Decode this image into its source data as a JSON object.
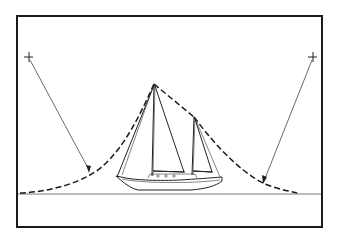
{
  "figure": {
    "frame": {
      "x": 17,
      "y": 16,
      "width": 305,
      "height": 211
    },
    "horizon_y": 194,
    "colors": {
      "ink": "#1a1a1a",
      "background": "#ffffff"
    },
    "elements": [
      {
        "name": "left-sighting-mark",
        "x": 28,
        "y": 57
      },
      {
        "name": "right-sighting-mark",
        "x": 312,
        "y": 57
      },
      {
        "name": "main-masthead",
        "x": 154,
        "y": 84
      },
      {
        "name": "mizzen-masthead",
        "x": 194,
        "y": 117
      },
      {
        "name": "left-arrow-tip",
        "x": 89,
        "y": 172
      },
      {
        "name": "right-arrow-tip",
        "x": 263,
        "y": 183
      }
    ]
  }
}
